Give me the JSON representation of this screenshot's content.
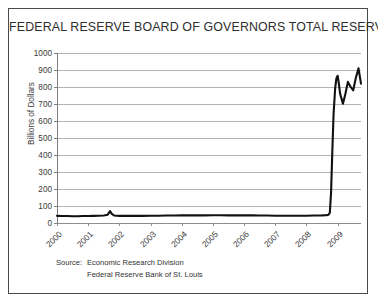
{
  "figure": {
    "title": "FEDERAL RESERVE BOARD OF GOVERNORS TOTAL RESERVES",
    "border_color": "#4a4a4a",
    "background": "#ffffff"
  },
  "source": {
    "label": "Source:",
    "line1": "Economic Research Division",
    "line2": "Federal Reserve Bank of St. Louis"
  },
  "chart_data": {
    "type": "line",
    "title": "FEDERAL RESERVE BOARD OF GOVERNORS TOTAL RESERVES",
    "subtitle": "",
    "xlabel": "",
    "ylabel": "Billions of Dollars",
    "xlim": [
      2000.0,
      2009.75
    ],
    "ylim": [
      0,
      1000
    ],
    "yticks": [
      0,
      100,
      200,
      300,
      400,
      500,
      600,
      700,
      800,
      900,
      1000
    ],
    "ytick_labels": [
      "0",
      "100",
      "200",
      "300",
      "400",
      "500",
      "600",
      "700",
      "800",
      "900",
      "1000"
    ],
    "xticks": [
      2000,
      2001,
      2002,
      2003,
      2004,
      2005,
      2006,
      2007,
      2008,
      2009
    ],
    "xtick_labels": [
      "2000",
      "2001",
      "2002",
      "2003",
      "2004",
      "2005",
      "2006",
      "2007",
      "2008",
      "2009"
    ],
    "grid": true,
    "grid_axis": "y",
    "grid_color": "#b4b4b4",
    "legend": false,
    "line_color": "#111111",
    "line_width": 2.1,
    "series": [
      {
        "name": "Total Reserves",
        "units": "Billions of Dollars",
        "x": [
          2000.0,
          2000.17,
          2000.33,
          2000.5,
          2000.67,
          2000.83,
          2001.0,
          2001.17,
          2001.33,
          2001.5,
          2001.62,
          2001.7,
          2001.75,
          2001.83,
          2001.92,
          2002.0,
          2002.25,
          2002.5,
          2002.75,
          2003.0,
          2003.25,
          2003.5,
          2003.75,
          2004.0,
          2004.25,
          2004.5,
          2004.75,
          2005.0,
          2005.25,
          2005.5,
          2005.75,
          2006.0,
          2006.25,
          2006.5,
          2006.75,
          2007.0,
          2007.25,
          2007.5,
          2007.75,
          2008.0,
          2008.25,
          2008.5,
          2008.62,
          2008.7,
          2008.75,
          2008.79,
          2008.83,
          2008.87,
          2008.92,
          2008.96,
          2009.0,
          2009.04,
          2009.08,
          2009.17,
          2009.25,
          2009.33,
          2009.42,
          2009.5,
          2009.58,
          2009.67,
          2009.75
        ],
        "values": [
          42,
          41,
          41,
          40,
          40,
          41,
          41,
          42,
          43,
          44,
          48,
          70,
          55,
          44,
          43,
          42,
          42,
          42,
          42,
          43,
          43,
          44,
          44,
          45,
          45,
          45,
          45,
          46,
          46,
          45,
          45,
          45,
          45,
          44,
          44,
          43,
          43,
          43,
          43,
          43,
          44,
          45,
          46,
          48,
          60,
          180,
          420,
          640,
          790,
          850,
          866,
          820,
          760,
          702,
          760,
          830,
          800,
          780,
          850,
          910,
          820
        ]
      }
    ],
    "annotations": [
      {
        "text": "September 2001 liquidity bump",
        "x": 2001.7,
        "y": 70,
        "visible": false
      },
      {
        "text": "Late-2008 quantitative easing surge",
        "x": 2008.83,
        "y": 420,
        "visible": false
      }
    ]
  }
}
